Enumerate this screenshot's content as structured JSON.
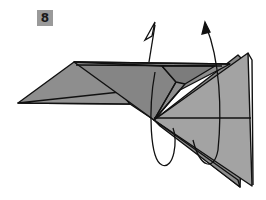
{
  "step": {
    "number": "8"
  },
  "diagram": {
    "instruction_arrows": [
      {
        "type": "open-arrowhead",
        "meaning": "valley-fold-up"
      },
      {
        "type": "solid-arrowhead",
        "meaning": "fold-behind-up"
      }
    ],
    "colors": {
      "paper_fill": "#8e8e8e",
      "paper_fill_light": "#a3a3a3",
      "paper_fill_dark": "#7a7a7a",
      "line": "#111111",
      "badge_bg": "#9a9a9a"
    }
  }
}
